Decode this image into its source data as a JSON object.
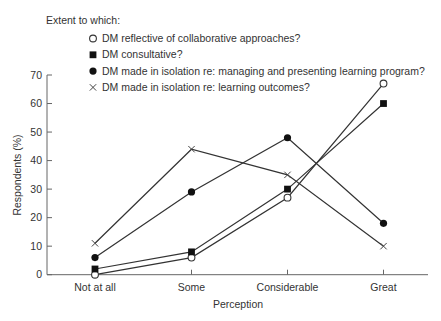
{
  "chart_data": {
    "type": "line",
    "title": "",
    "legend_title": "Extent to which:",
    "legend_position": "top",
    "categories": [
      "Not at all",
      "Some",
      "Considerable",
      "Great"
    ],
    "xlabel": "Perception",
    "ylabel": "Respondents (%)",
    "ylim": [
      0,
      70
    ],
    "yticks": [
      0,
      10,
      20,
      30,
      40,
      50,
      60,
      70
    ],
    "grid": false,
    "series": [
      {
        "name": "DM reflective of collaborative approaches?",
        "marker": "open-circle",
        "values": [
          0,
          6,
          27,
          67
        ]
      },
      {
        "name": "DM consultative?",
        "marker": "filled-square",
        "values": [
          2,
          8,
          30,
          60
        ]
      },
      {
        "name": "DM made in isolation re: managing and presenting learning program?",
        "marker": "filled-circle",
        "values": [
          6,
          29,
          48,
          18
        ]
      },
      {
        "name": "DM made in isolation re: learning outcomes?",
        "marker": "cross",
        "values": [
          11,
          44,
          35,
          10
        ]
      }
    ],
    "colors": {
      "line": "#333333",
      "text": "#333333",
      "axis": "#666666"
    }
  }
}
